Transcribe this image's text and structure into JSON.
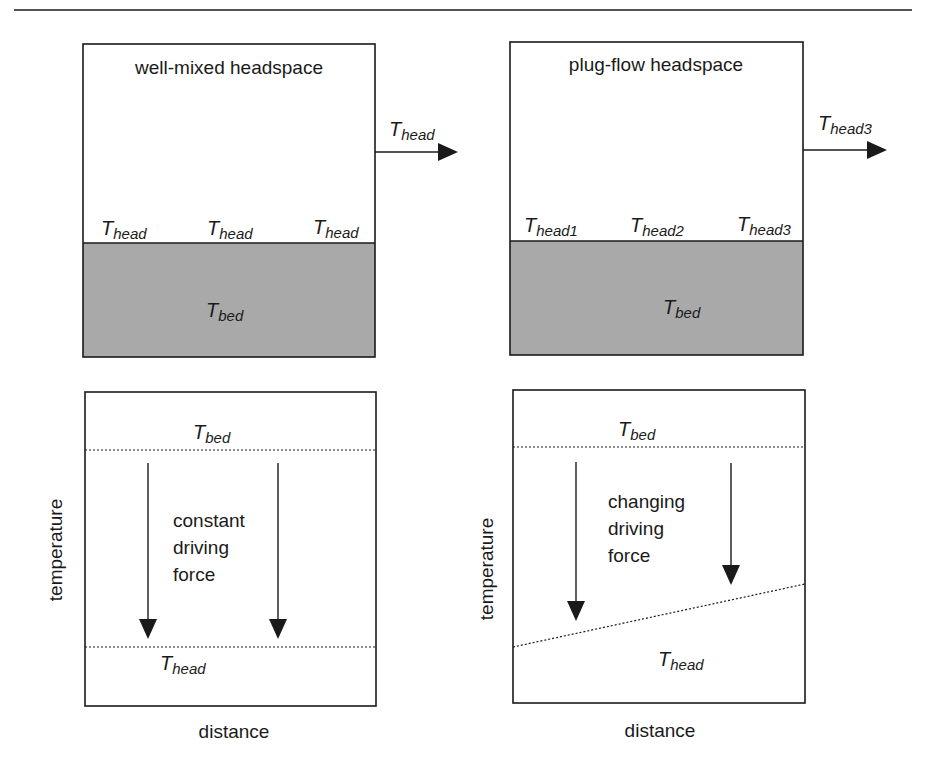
{
  "colors": {
    "bed_fill": "#a9a9a9",
    "line": "#1a1a1a",
    "background": "#ffffff"
  },
  "top_left": {
    "title": "well-mixed headspace",
    "outlet_label": {
      "main": "T",
      "sub": "head"
    },
    "surface_labels": [
      {
        "main": "T",
        "sub": "head"
      },
      {
        "main": "T",
        "sub": "head"
      },
      {
        "main": "T",
        "sub": "head"
      }
    ],
    "bed_label": {
      "main": "T",
      "sub": "bed"
    }
  },
  "top_right": {
    "title": "plug-flow headspace",
    "outlet_label": {
      "main": "T",
      "sub": "head3"
    },
    "surface_labels": [
      {
        "main": "T",
        "sub": "head1"
      },
      {
        "main": "T",
        "sub": "head2"
      },
      {
        "main": "T",
        "sub": "head3"
      }
    ],
    "bed_label": {
      "main": "T",
      "sub": "bed"
    }
  },
  "bottom_left": {
    "ylabel": "temperature",
    "xlabel": "distance",
    "bed_line_label": {
      "main": "T",
      "sub": "bed"
    },
    "head_line_label": {
      "main": "T",
      "sub": "head"
    },
    "caption_lines": [
      "constant",
      "driving",
      "force"
    ]
  },
  "bottom_right": {
    "ylabel": "temperature",
    "xlabel": "distance",
    "bed_line_label": {
      "main": "T",
      "sub": "bed"
    },
    "head_line_label": {
      "main": "T",
      "sub": "head"
    },
    "caption_lines": [
      "changing",
      "driving",
      "force"
    ]
  }
}
